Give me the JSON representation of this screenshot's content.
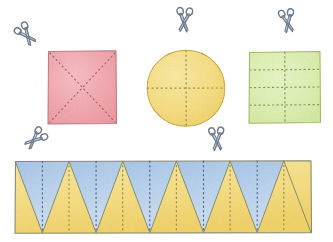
{
  "illustration": {
    "title": "Paper shapes with fold lines and scissors",
    "style": "watercolor-hand-drawn",
    "background_color": "#ffffff",
    "width": 333,
    "height": 242
  },
  "palette": {
    "pink_fill": "#f3a9b0",
    "pink_stroke": "#c97d86",
    "yellow_fill": "#f7df85",
    "yellow_stroke": "#cbb04e",
    "green_fill": "#dcefb0",
    "green_stroke": "#a8bf72",
    "blue_fill": "#b3cdea",
    "blue_stroke": "#7f9cc0",
    "outline": "#8a8a72",
    "dotted_line": "#9a8f55",
    "dotted_line_pink": "#a8636d",
    "dotted_line_green": "#8a9a55",
    "dotted_line_blue": "#55688a",
    "scissors_body": "#c3ced9",
    "scissors_stroke": "#6e7c8c"
  },
  "shapes": [
    {
      "id": "pink-square",
      "label": "Pink square",
      "type": "square",
      "color_name": "pink",
      "fill": "#f3a9b0",
      "stroke": "#c97d86",
      "x": 48,
      "y": 51,
      "width": 68,
      "height": 73,
      "fold_lines": "two diagonals forming an X",
      "fold_line_count": 2,
      "sections": 4
    },
    {
      "id": "yellow-circle",
      "label": "Yellow circle",
      "type": "circle",
      "color_name": "yellow",
      "fill": "#f7df85",
      "stroke": "#cbb04e",
      "cx": 186,
      "cy": 88,
      "r": 38,
      "fold_lines": "one vertical and one horizontal through centre",
      "fold_line_count": 2,
      "sections": 4
    },
    {
      "id": "green-square",
      "label": "Green square",
      "type": "square",
      "color_name": "green",
      "fill": "#dcefb0",
      "stroke": "#a8bf72",
      "x": 249,
      "y": 52,
      "width": 71,
      "height": 71,
      "fold_lines": "three horizontal and one vertical",
      "horizontal_fold_count": 3,
      "vertical_fold_count": 1,
      "sections": 8
    },
    {
      "id": "triangle-strip",
      "label": "Blue and yellow zigzag triangle strip",
      "type": "strip",
      "color_names": [
        "blue",
        "yellow"
      ],
      "blue_fill": "#b3cdea",
      "yellow_fill": "#f7df85",
      "x": 15,
      "y": 161,
      "width": 296,
      "height": 72,
      "triangle_count": 11,
      "up_triangles": 6,
      "down_triangles": 5,
      "up_color": "yellow",
      "down_color": "blue",
      "fold_lines": "vertical dotted line down the centre of every triangle"
    }
  ],
  "scissors": [
    {
      "id": "scissors-pink-square",
      "label": "Scissors near pink square",
      "x": 28,
      "y": 37,
      "rotation": -38,
      "scale": 1.0
    },
    {
      "id": "scissors-yellow-circle",
      "label": "Scissors above yellow circle",
      "x": 184,
      "y": 23,
      "rotation": 4,
      "scale": 1.05
    },
    {
      "id": "scissors-green-square",
      "label": "Scissors above green square",
      "x": 288,
      "y": 24,
      "rotation": -10,
      "scale": 1.0
    },
    {
      "id": "scissors-strip-left",
      "label": "Scissors left of triangle strip",
      "x": 33,
      "y": 141,
      "rotation": 48,
      "scale": 1.0
    },
    {
      "id": "scissors-strip-top",
      "label": "Scissors above triangle strip",
      "x": 217,
      "y": 142,
      "rotation": -4,
      "scale": 1.0
    }
  ]
}
